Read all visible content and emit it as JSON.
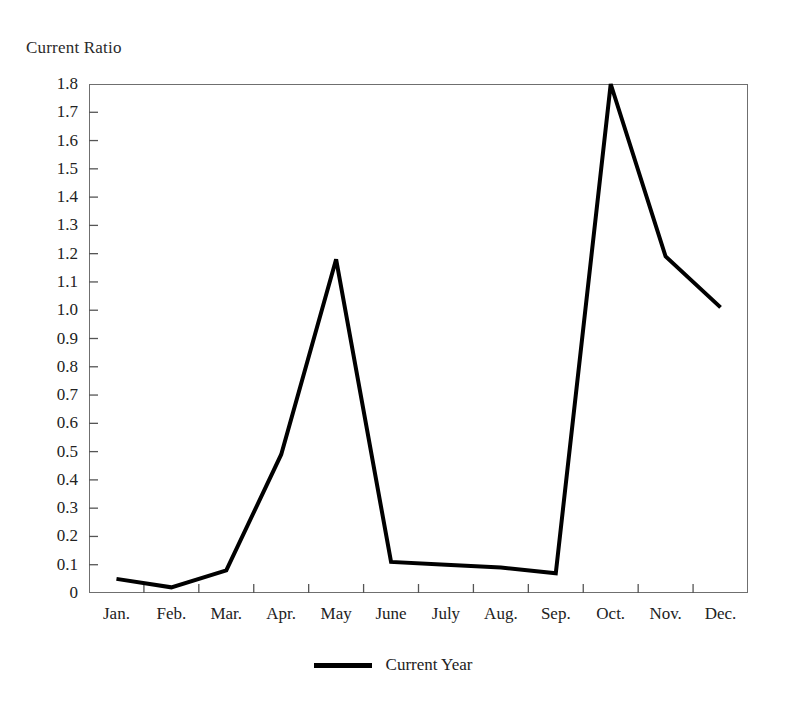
{
  "chart_data": {
    "type": "line",
    "title": "Current Ratio",
    "xlabel": "",
    "ylabel": "Current Ratio",
    "categories": [
      "Jan.",
      "Feb.",
      "Mar.",
      "Apr.",
      "May",
      "June",
      "July",
      "Aug.",
      "Sep.",
      "Oct.",
      "Nov.",
      "Dec."
    ],
    "series": [
      {
        "name": "Current Year",
        "color": "#000000",
        "values": [
          0.05,
          0.02,
          0.08,
          0.49,
          1.18,
          0.11,
          0.1,
          0.09,
          0.07,
          1.8,
          1.19,
          1.01
        ]
      }
    ],
    "ylim": [
      0,
      1.8
    ],
    "ytick_values": [
      1.8,
      1.7,
      1.6,
      1.5,
      1.4,
      1.3,
      1.2,
      1.1,
      1.0,
      0.9,
      0.8,
      0.7,
      0.6,
      0.5,
      0.4,
      0.3,
      0.2,
      0.1,
      0
    ],
    "ytick_labels": [
      "1.8",
      "1.7",
      "1.6",
      "1.5",
      "1.4",
      "1.3",
      "1.2",
      "1.1",
      "1.0",
      "0.9",
      "0.8",
      "0.7",
      "0.6",
      "0.5",
      "0.4",
      "0.3",
      "0.2",
      "0.1",
      "0"
    ],
    "grid": false,
    "legend_position": "bottom",
    "frame_color": "#6f6f6f",
    "tick_color": "#555555",
    "line_width": 4
  },
  "legend": {
    "entries": [
      {
        "label": "Current Year"
      }
    ]
  }
}
